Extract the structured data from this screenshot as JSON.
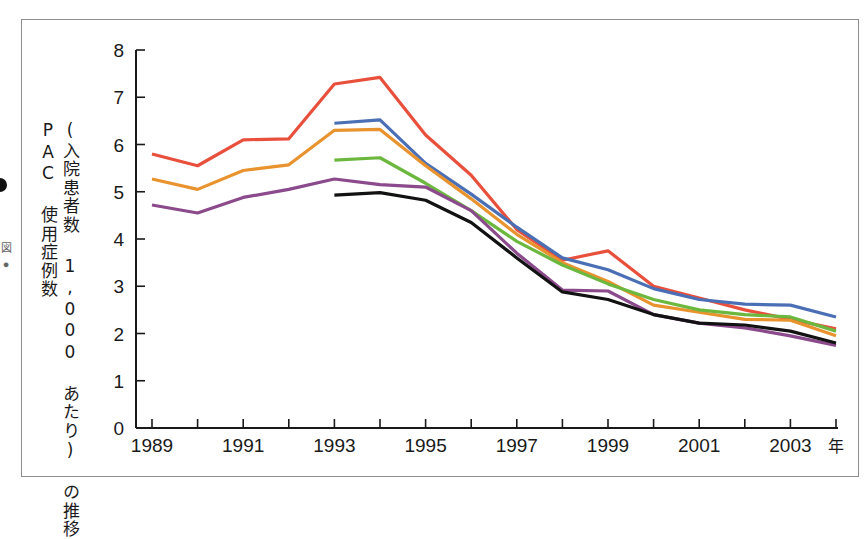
{
  "figure": {
    "margin_note": "図 ●",
    "frame_color": "#8e8e8e"
  },
  "chart_data": {
    "type": "line",
    "title": "",
    "subtitle": "",
    "xlabel": "年",
    "ylabel_line1": "PAC 使用症例数",
    "ylabel_line2": "(入院患者数 1,000 あたり) の推移",
    "grid": false,
    "legend_position": "none",
    "xlim": [
      1989,
      2004
    ],
    "ylim": [
      0,
      8
    ],
    "ytick_labels": [
      "0",
      "1",
      "2",
      "3",
      "4",
      "5",
      "6",
      "7",
      "8"
    ],
    "ytick_values": [
      0,
      1,
      2,
      3,
      4,
      5,
      6,
      7,
      8
    ],
    "x": [
      1989,
      1990,
      1991,
      1992,
      1993,
      1994,
      1995,
      1996,
      1997,
      1998,
      1999,
      2000,
      2001,
      2002,
      2003,
      2004
    ],
    "xtick_labels_shown": [
      "1989",
      "1991",
      "1993",
      "1995",
      "1997",
      "1999",
      "2001",
      "2003"
    ],
    "xtick_values_shown": [
      1989,
      1991,
      1993,
      1995,
      1997,
      1999,
      2001,
      2003
    ],
    "series": [
      {
        "name": "series-red",
        "color": "#e8503c",
        "x": [
          1989,
          1990,
          1991,
          1992,
          1993,
          1994,
          1995,
          1996,
          1997,
          1998,
          1999,
          2000,
          2001,
          2002,
          2003,
          2004
        ],
        "values": [
          5.8,
          5.55,
          6.1,
          6.12,
          7.28,
          7.42,
          6.2,
          5.35,
          4.2,
          3.55,
          3.75,
          3.0,
          2.75,
          2.5,
          2.3,
          2.1
        ]
      },
      {
        "name": "series-blue",
        "color": "#4a6fb5",
        "x": [
          1993,
          1994,
          1995,
          1996,
          1997,
          1998,
          1999,
          2000,
          2001,
          2002,
          2003,
          2004
        ],
        "values": [
          6.45,
          6.52,
          5.6,
          4.95,
          4.25,
          3.6,
          3.35,
          2.95,
          2.72,
          2.62,
          2.6,
          2.35
        ]
      },
      {
        "name": "series-orange",
        "color": "#e8932e",
        "x": [
          1989,
          1990,
          1991,
          1992,
          1993,
          1994,
          1995,
          1996,
          1997,
          1998,
          1999,
          2000,
          2001,
          2002,
          2003,
          2004
        ],
        "values": [
          5.27,
          5.05,
          5.45,
          5.57,
          6.3,
          6.32,
          5.55,
          4.85,
          4.1,
          3.5,
          3.1,
          2.6,
          2.45,
          2.3,
          2.28,
          1.95
        ]
      },
      {
        "name": "series-green",
        "color": "#6cb83f",
        "x": [
          1993,
          1994,
          1995,
          1996,
          1997,
          1998,
          1999,
          2000,
          2001,
          2002,
          2003,
          2004
        ],
        "values": [
          5.67,
          5.72,
          5.18,
          4.6,
          3.95,
          3.45,
          3.05,
          2.72,
          2.5,
          2.4,
          2.35,
          2.05
        ]
      },
      {
        "name": "series-purple",
        "color": "#8b4a8b",
        "x": [
          1989,
          1990,
          1991,
          1992,
          1993,
          1994,
          1995,
          1996,
          1997,
          1998,
          1999,
          2000,
          2001,
          2002,
          2003,
          2004
        ],
        "values": [
          4.72,
          4.55,
          4.88,
          5.05,
          5.27,
          5.15,
          5.1,
          4.6,
          3.7,
          2.92,
          2.9,
          2.4,
          2.22,
          2.12,
          1.95,
          1.75
        ]
      },
      {
        "name": "series-black",
        "color": "#121212",
        "x": [
          1993,
          1994,
          1995,
          1996,
          1997,
          1998,
          1999,
          2000,
          2001,
          2002,
          2003,
          2004
        ],
        "values": [
          4.93,
          4.98,
          4.82,
          4.35,
          3.6,
          2.88,
          2.72,
          2.4,
          2.22,
          2.18,
          2.05,
          1.8
        ]
      }
    ]
  }
}
